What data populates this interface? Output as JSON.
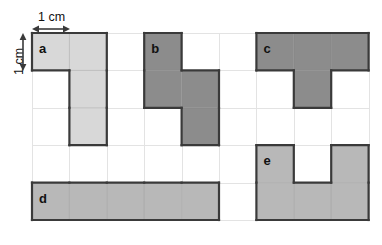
{
  "figure": {
    "background_color": "#ffffff",
    "grid": {
      "columns": 9,
      "rows": 5,
      "cell_size_px": 37.4,
      "origin_x_px": 32,
      "origin_y_px": 33,
      "line_color": "#e3e3e3"
    }
  },
  "measurements": [
    {
      "id": "horizontal-scale",
      "label": "1 cm",
      "orientation": "horizontal",
      "describes": "width of one grid cell"
    },
    {
      "id": "vertical-scale",
      "label": "1 cm",
      "orientation": "vertical",
      "describes": "height of one grid cell"
    }
  ],
  "shapes": [
    {
      "id": "a",
      "label": "a",
      "fill": "#d8d8d8",
      "stroke": "#3a3a3a",
      "cell_count": 4,
      "shape_type": "L-tetromino",
      "cells": [
        [
          0,
          0
        ],
        [
          1,
          0
        ],
        [
          1,
          1
        ],
        [
          1,
          2
        ]
      ],
      "label_cell": [
        0,
        0
      ]
    },
    {
      "id": "b",
      "label": "b",
      "fill": "#8c8c8c",
      "stroke": "#3a3a3a",
      "cell_count": 4,
      "shape_type": "S-tetromino",
      "cells": [
        [
          3,
          0
        ],
        [
          3,
          1
        ],
        [
          4,
          1
        ],
        [
          4,
          2
        ]
      ],
      "label_cell": [
        3,
        0
      ]
    },
    {
      "id": "c",
      "label": "c",
      "fill": "#8c8c8c",
      "stroke": "#3a3a3a",
      "cell_count": 4,
      "shape_type": "T-tetromino",
      "cells": [
        [
          6,
          0
        ],
        [
          7,
          0
        ],
        [
          8,
          0
        ],
        [
          7,
          1
        ]
      ],
      "label_cell": [
        6,
        0
      ]
    },
    {
      "id": "d",
      "label": "d",
      "fill": "#b8b8b8",
      "stroke": "#3a3a3a",
      "cell_count": 5,
      "shape_type": "I-pentomino",
      "cells": [
        [
          0,
          4
        ],
        [
          1,
          4
        ],
        [
          2,
          4
        ],
        [
          3,
          4
        ],
        [
          4,
          4
        ]
      ],
      "label_cell": [
        0,
        4
      ]
    },
    {
      "id": "e",
      "label": "e",
      "fill": "#b8b8b8",
      "stroke": "#3a3a3a",
      "cell_count": 5,
      "shape_type": "U-pentomino",
      "cells": [
        [
          6,
          3
        ],
        [
          8,
          3
        ],
        [
          6,
          4
        ],
        [
          7,
          4
        ],
        [
          8,
          4
        ]
      ],
      "label_cell": [
        6,
        3
      ]
    }
  ]
}
